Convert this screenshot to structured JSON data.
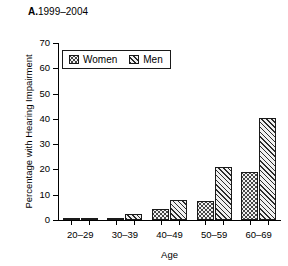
{
  "panel": {
    "letter": "A.",
    "title": "1999–2004"
  },
  "legend": {
    "position": "top-left-inside",
    "entries": [
      {
        "label": "Women",
        "pattern": "dotted",
        "swatch_name": "legend-swatch-women"
      },
      {
        "label": "Men",
        "pattern": "diagonal-hatch",
        "swatch_name": "legend-swatch-men"
      }
    ]
  },
  "axes": {
    "y_title": "Percentage with Hearing Impairment",
    "x_title": "Age",
    "y_ticks": [
      "0",
      "10",
      "20",
      "30",
      "40",
      "50",
      "60",
      "70"
    ],
    "x_ticks": [
      "20–29",
      "30–39",
      "40–49",
      "50–59",
      "60–69"
    ]
  },
  "chart_data": {
    "type": "bar",
    "title": "A.1999–2004",
    "xlabel": "Age",
    "ylabel": "Percentage with Hearing Impairment",
    "categories": [
      "20–29",
      "30–39",
      "40–49",
      "50–59",
      "60–69"
    ],
    "series": [
      {
        "name": "Women",
        "values": [
          0.3,
          0.8,
          4.5,
          7.5,
          19
        ]
      },
      {
        "name": "Men",
        "values": [
          0.5,
          2.2,
          8,
          21,
          40.5
        ]
      }
    ],
    "ylim": [
      0,
      70
    ],
    "ytick_step": 10,
    "grid": false,
    "legend_position": "upper left",
    "colors": {
      "women": "#f2f2f2",
      "men": "#f0f0f0",
      "outline": "#1a1a1a"
    }
  }
}
